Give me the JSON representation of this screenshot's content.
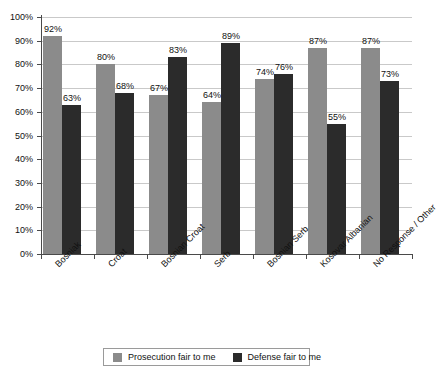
{
  "chart_data": {
    "type": "bar",
    "title": "",
    "subtitle": "",
    "xlabel": "",
    "ylabel": "",
    "ylim": [
      0,
      100
    ],
    "y_tick_step": 10,
    "y_tick_labels": [
      "0%",
      "10%",
      "20%",
      "30%",
      "40%",
      "50%",
      "60%",
      "70%",
      "80%",
      "90%",
      "100%"
    ],
    "grid": "horizontal",
    "legend_position": "bottom",
    "value_labels": true,
    "value_label_suffix": "%",
    "categories": [
      "Bosniak",
      "Croat",
      "Bosnian Croat",
      "Serb",
      "Bosnian Serb",
      "Kosovar Albanian",
      "No Response / Other"
    ],
    "series": [
      {
        "name": "Prosecution fair to me",
        "color": "#8b8b8b",
        "values": [
          92,
          80,
          67,
          64,
          74,
          87,
          87
        ],
        "labels": [
          "92%",
          "80%",
          "67%",
          "64%",
          "74%",
          "87%",
          "87%"
        ]
      },
      {
        "name": "Defense fair to me",
        "color": "#2b2b2b",
        "values": [
          63,
          68,
          83,
          89,
          76,
          55,
          73
        ],
        "labels": [
          "63%",
          "68%",
          "83%",
          "89%",
          "76%",
          "55%",
          "73%"
        ]
      }
    ]
  },
  "colors": {
    "series_prosecution": "#8b8b8b",
    "series_defense": "#2b2b2b",
    "gridline": "#c9c9c9",
    "axis": "#4a4a4a",
    "background": "#ffffff",
    "text": "#111111"
  }
}
